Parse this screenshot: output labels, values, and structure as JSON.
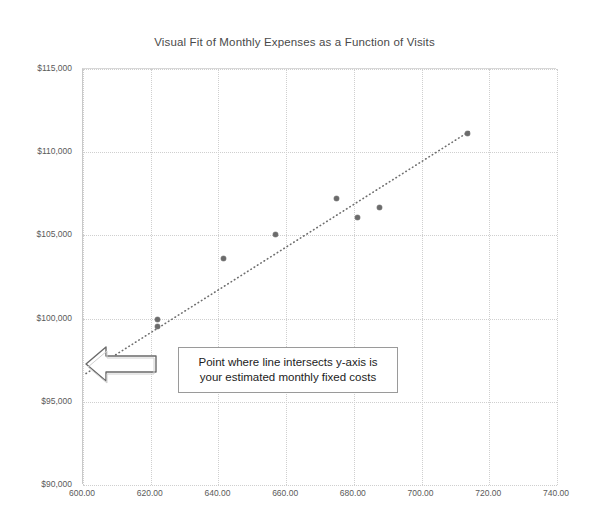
{
  "chart_data": {
    "type": "scatter",
    "title": "Visual Fit of Monthly Expenses as a Function of Visits",
    "xlabel": "",
    "ylabel": "",
    "xlim": [
      600,
      740
    ],
    "ylim": [
      90000,
      115000
    ],
    "grid": true,
    "legend": "none",
    "x_tick_labels": [
      "600.00",
      "620.00",
      "640.00",
      "660.00",
      "680.00",
      "700.00",
      "720.00",
      "740.00"
    ],
    "x_ticks": [
      600,
      620,
      640,
      660,
      680,
      700,
      720,
      740
    ],
    "y_tick_labels": [
      "$115,000",
      "$110,000",
      "$105,000",
      "$100,000",
      "$95,000",
      "$90,000"
    ],
    "y_ticks": [
      115000,
      110000,
      105000,
      100000,
      95000,
      90000
    ],
    "series": [
      {
        "name": "Monthly Expenses",
        "marker": "circle",
        "color": "#6b6b6b",
        "points": [
          {
            "x": 622.0,
            "y": 99950
          },
          {
            "x": 622.0,
            "y": 99500
          },
          {
            "x": 641.5,
            "y": 103600
          },
          {
            "x": 657.0,
            "y": 105050
          },
          {
            "x": 675.0,
            "y": 107200
          },
          {
            "x": 681.0,
            "y": 106100
          },
          {
            "x": 687.5,
            "y": 106700
          },
          {
            "x": 713.5,
            "y": 111100
          }
        ]
      },
      {
        "name": "Visual fit trendline",
        "type": "line",
        "style": "dotted",
        "color": "#6e6e6e",
        "endpoints": [
          {
            "x": 600.9,
            "y": 96700
          },
          {
            "x": 714.5,
            "y": 111300
          }
        ]
      }
    ],
    "annotations": [
      {
        "name": "fixed-costs-callout",
        "text_lines": [
          "Point where line intersects y-axis is",
          "your estimated monthly fixed costs"
        ],
        "arrow": "left-block-arrow",
        "points_to": {
          "x": 600.9,
          "y": 96700
        }
      }
    ]
  },
  "annotation": {
    "line1": "Point where line intersects y-axis is",
    "line2": "your estimated monthly fixed costs"
  },
  "colors": {
    "marker": "#6b6b6b",
    "gridline": "#cfcfcf",
    "axis": "#c9c9c9",
    "title_text": "#4a4a4a",
    "tick_text": "#5a5a5a",
    "callout_border": "#9a9a9a",
    "arrow_stroke": "#6a6a6a"
  }
}
